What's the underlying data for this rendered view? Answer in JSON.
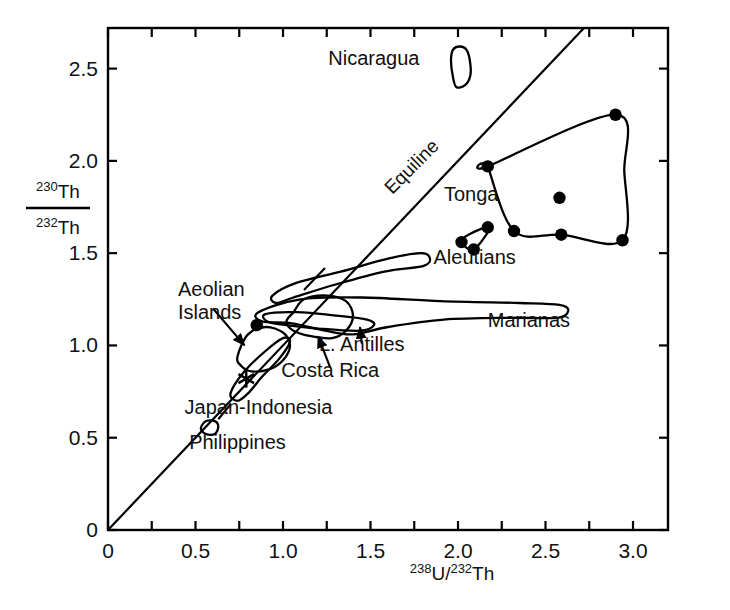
{
  "figure": {
    "kind": "scatter-field-diagram",
    "background_color": "#ffffff",
    "ink_color": "#000000"
  },
  "axes": {
    "x_label_parts": {
      "sup1": "238",
      "base1": "U/",
      "sup2": "232",
      "base2": "Th"
    },
    "y_label_parts": {
      "num_sup": "230",
      "num_base": "Th",
      "den_sup": "232",
      "den_base": "Th"
    },
    "x_ticks": [
      "0",
      "0.5",
      "1.0",
      "1.5",
      "2.0",
      "2.5",
      "3.0"
    ],
    "y_ticks": [
      "0",
      "0.5",
      "1.0",
      "1.5",
      "2.0",
      "2.5"
    ],
    "x_tick_values": [
      0,
      0.5,
      1.0,
      1.5,
      2.0,
      2.5,
      3.0
    ],
    "y_tick_values": [
      0,
      0.5,
      1.0,
      1.5,
      2.0,
      2.5
    ],
    "xlim": [
      0,
      3.2
    ],
    "ylim": [
      0,
      2.72
    ],
    "grid": false,
    "frame": "box",
    "tick_direction": "in"
  },
  "chart_data": {
    "type": "scatter",
    "title": "",
    "xlabel": "238U/232Th",
    "ylabel": "230Th/232Th",
    "xlim": [
      0,
      3.2
    ],
    "ylim": [
      0,
      2.72
    ],
    "grid": false,
    "legend_position": "inline-annotations",
    "reference_lines": [
      {
        "name": "Equiline",
        "label": "Equiline",
        "description": "1:1 line through origin, 230Th/232Th = 238U/232Th",
        "slope": 1.0,
        "intercept": 0.0,
        "x_from": 0.0,
        "x_to": 2.72,
        "label_rotation_deg": -45
      }
    ],
    "fields": [
      {
        "name": "Nicaragua",
        "label": "Nicaragua",
        "label_x": 1.78,
        "label_y": 2.52,
        "label_anchor": "end",
        "centroid": [
          2.02,
          2.5
        ],
        "outline": [
          [
            1.99,
            2.4
          ],
          [
            2.04,
            2.41
          ],
          [
            2.07,
            2.46
          ],
          [
            2.07,
            2.53
          ],
          [
            2.05,
            2.6
          ],
          [
            2.01,
            2.62
          ],
          [
            1.97,
            2.6
          ],
          [
            1.96,
            2.54
          ],
          [
            1.97,
            2.46
          ]
        ]
      },
      {
        "name": "Tonga",
        "label": "Tonga",
        "label_x": 1.92,
        "label_y": 1.78,
        "label_anchor": "start",
        "centroid": [
          2.6,
          1.9
        ],
        "outline": [
          [
            2.17,
            1.97
          ],
          [
            2.9,
            2.25
          ],
          [
            2.95,
            1.94
          ],
          [
            2.94,
            1.57
          ],
          [
            2.59,
            1.6
          ],
          [
            2.32,
            1.62
          ],
          [
            2.17,
            1.97
          ]
        ],
        "points": [
          [
            2.17,
            1.97
          ],
          [
            2.9,
            2.25
          ],
          [
            2.94,
            1.57
          ],
          [
            2.59,
            1.6
          ],
          [
            2.32,
            1.62
          ],
          [
            2.58,
            1.8
          ]
        ]
      },
      {
        "name": "Tonga-satellite-cluster",
        "label": "",
        "centroid": [
          2.12,
          1.6
        ],
        "outline": [
          [
            2.02,
            1.56
          ],
          [
            2.09,
            1.52
          ],
          [
            2.18,
            1.64
          ],
          [
            2.06,
            1.6
          ]
        ],
        "points": [
          [
            2.02,
            1.56
          ],
          [
            2.09,
            1.52
          ],
          [
            2.17,
            1.64
          ]
        ]
      },
      {
        "name": "Aleutians",
        "label": "Aleutians",
        "label_x": 1.86,
        "label_y": 1.44,
        "label_anchor": "start",
        "centroid": [
          1.35,
          1.35
        ],
        "outline": [
          [
            0.94,
            1.27
          ],
          [
            1.08,
            1.34
          ],
          [
            1.33,
            1.4
          ],
          [
            1.6,
            1.47
          ],
          [
            1.79,
            1.5
          ],
          [
            1.84,
            1.47
          ],
          [
            1.8,
            1.43
          ],
          [
            1.58,
            1.4
          ],
          [
            1.3,
            1.33
          ],
          [
            1.06,
            1.26
          ],
          [
            0.96,
            1.23
          ]
        ]
      },
      {
        "name": "Marianas",
        "label": "Marianas",
        "label_x": 2.17,
        "label_y": 1.1,
        "label_anchor": "start",
        "centroid": [
          1.9,
          1.21
        ],
        "outline": [
          [
            0.86,
            1.18
          ],
          [
            1.1,
            1.25
          ],
          [
            1.45,
            1.26
          ],
          [
            1.9,
            1.24
          ],
          [
            2.35,
            1.23
          ],
          [
            2.58,
            1.22
          ],
          [
            2.63,
            1.19
          ],
          [
            2.57,
            1.15
          ],
          [
            2.3,
            1.15
          ],
          [
            1.92,
            1.14
          ],
          [
            1.6,
            1.1
          ],
          [
            1.4,
            1.06
          ],
          [
            1.24,
            1.08
          ],
          [
            1.05,
            1.12
          ],
          [
            0.88,
            1.13
          ]
        ]
      },
      {
        "name": "L. Antilles",
        "label": "L. Antilles",
        "label_x": 1.45,
        "label_y": 0.97,
        "label_anchor": "middle",
        "centroid": [
          1.25,
          1.14
        ],
        "outline": [
          [
            0.9,
            1.17
          ],
          [
            1.08,
            1.18
          ],
          [
            1.32,
            1.16
          ],
          [
            1.48,
            1.14
          ],
          [
            1.52,
            1.11
          ],
          [
            1.44,
            1.08
          ],
          [
            1.22,
            1.09
          ],
          [
            1.02,
            1.11
          ],
          [
            0.91,
            1.13
          ]
        ]
      },
      {
        "name": "Costa Rica",
        "label": "Costa Rica",
        "label_x": 1.27,
        "label_y": 0.83,
        "label_anchor": "middle",
        "centroid": [
          1.22,
          1.16
        ],
        "outline": [
          [
            1.06,
            1.18
          ],
          [
            1.12,
            1.25
          ],
          [
            1.25,
            1.27
          ],
          [
            1.36,
            1.24
          ],
          [
            1.4,
            1.16
          ],
          [
            1.36,
            1.08
          ],
          [
            1.28,
            1.04
          ],
          [
            1.16,
            1.05
          ],
          [
            1.06,
            1.08
          ],
          [
            1.02,
            1.13
          ]
        ]
      },
      {
        "name": "Aeolian Islands",
        "label": "Aeolian\nIslands",
        "label_line1": "Aeolian",
        "label_line2": "Islands",
        "label_x": 0.4,
        "label_y": 1.27,
        "label_anchor": "start",
        "centroid": [
          0.86,
          1.0
        ],
        "outline": [
          [
            0.74,
            0.94
          ],
          [
            0.8,
            1.06
          ],
          [
            0.9,
            1.1
          ],
          [
            1.0,
            1.07
          ],
          [
            1.04,
            1.0
          ],
          [
            1.0,
            0.92
          ],
          [
            0.92,
            0.87
          ],
          [
            0.82,
            0.86
          ],
          [
            0.76,
            0.89
          ]
        ]
      },
      {
        "name": "Japan-Indonesia",
        "label": "Japan-Indonesia",
        "label_x": 0.86,
        "label_y": 0.63,
        "label_anchor": "middle",
        "centroid": [
          0.85,
          0.9
        ],
        "outline": [
          [
            0.7,
            0.74
          ],
          [
            0.78,
            0.86
          ],
          [
            0.9,
            0.97
          ],
          [
            1.0,
            1.04
          ],
          [
            1.04,
            1.02
          ],
          [
            0.98,
            0.93
          ],
          [
            0.88,
            0.83
          ],
          [
            0.8,
            0.74
          ],
          [
            0.74,
            0.7
          ]
        ]
      },
      {
        "name": "Philippines",
        "label": "Philippines",
        "label_x": 0.74,
        "label_y": 0.44,
        "label_anchor": "middle",
        "centroid": [
          0.58,
          0.56
        ],
        "outline": [
          [
            0.53,
            0.55
          ],
          [
            0.56,
            0.59
          ],
          [
            0.61,
            0.59
          ],
          [
            0.63,
            0.56
          ],
          [
            0.61,
            0.52
          ],
          [
            0.56,
            0.52
          ]
        ]
      }
    ],
    "markers": [
      {
        "name": "filled-circle-aeolian",
        "symbol": "filled-circle",
        "x": 0.85,
        "y": 1.11
      },
      {
        "name": "asterisk-japan-indonesia",
        "symbol": "asterisk",
        "x": 0.79,
        "y": 0.82
      }
    ],
    "leader_lines": [
      {
        "name": "aeolian-leader",
        "from": [
          0.6,
          1.2
        ],
        "to": [
          0.78,
          1.0
        ],
        "arrow": true
      },
      {
        "name": "costa-rica-leader",
        "from": [
          1.27,
          0.88
        ],
        "to": [
          1.2,
          1.05
        ],
        "arrow": true
      },
      {
        "name": "l-antilles-leader",
        "from": [
          1.45,
          1.01
        ],
        "to": [
          1.44,
          1.1
        ],
        "arrow": true
      },
      {
        "name": "aleutians-leader",
        "from": [
          1.24,
          1.42
        ],
        "to": [
          1.12,
          1.3
        ],
        "arrow": false
      },
      {
        "name": "philippines-leader",
        "from": [
          0.7,
          0.68
        ],
        "to": [
          0.63,
          0.6
        ],
        "arrow": false
      }
    ]
  }
}
